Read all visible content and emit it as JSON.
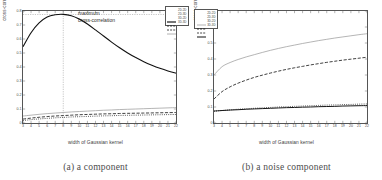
{
  "figure": {
    "panels": [
      {
        "id": "panel-a",
        "caption": "(a) a component",
        "annotation_line1": "maximum",
        "annotation_line2": "cross-correlation",
        "legend_position": "top-right"
      },
      {
        "id": "panel-b",
        "caption": "(b) a noise component",
        "legend_position": "top-left"
      }
    ]
  },
  "chart_data": [
    {
      "type": "line",
      "title": "",
      "subtitle": "(a) a component",
      "xlabel": "width of Gaussian kernel",
      "ylabel": "cross-correlation",
      "xlim": [
        3,
        22
      ],
      "ylim": [
        0,
        0.8
      ],
      "grid": false,
      "legend_position": "upper right",
      "xticks": [
        3,
        4,
        5,
        6,
        7,
        8,
        9,
        10,
        11,
        12,
        13,
        14,
        15,
        16,
        17,
        18,
        19,
        20,
        21,
        22
      ],
      "xticklabels": [
        "3",
        "4",
        "5",
        "6",
        "7",
        "8",
        "9",
        "10",
        "11",
        "12",
        "13",
        "14",
        "15",
        "16",
        "17",
        "18",
        "19",
        "20",
        "21",
        "22"
      ],
      "yticks": [
        0,
        0.1,
        0.2,
        0.3,
        0.4,
        0.5,
        0.6,
        0.7,
        0.8
      ],
      "yticklabels": [
        "0",
        "0.1",
        "0.2",
        "0.3",
        "0.4",
        "0.5",
        "0.6",
        "0.7",
        "0.8"
      ],
      "annotations": [
        {
          "text": "maximum",
          "x": 11,
          "y": 0.78
        },
        {
          "text": "cross-correlation",
          "x": 11,
          "y": 0.73
        }
      ],
      "marker_lines": {
        "vertical_x": 8,
        "horizontal_y": 0.775
      },
      "x": [
        3,
        4,
        5,
        6,
        7,
        8,
        9,
        10,
        11,
        12,
        13,
        14,
        15,
        16,
        17,
        18,
        19,
        20,
        21,
        22
      ],
      "series": [
        {
          "name": "2D-2D",
          "style": "solid",
          "color": "#111111",
          "values": [
            0.545,
            0.645,
            0.715,
            0.757,
            0.773,
            0.776,
            0.766,
            0.742,
            0.707,
            0.665,
            0.621,
            0.578,
            0.537,
            0.5,
            0.467,
            0.438,
            0.413,
            0.391,
            0.372,
            0.356
          ]
        },
        {
          "name": "2D-3D",
          "style": "dashed",
          "color": "#1c1c1c",
          "values": [
            0.028,
            0.035,
            0.041,
            0.046,
            0.05,
            0.053,
            0.056,
            0.059,
            0.061,
            0.063,
            0.065,
            0.066,
            0.068,
            0.069,
            0.07,
            0.071,
            0.072,
            0.073,
            0.074,
            0.075
          ]
        },
        {
          "name": "3D-2D",
          "style": "dotted",
          "color": "#2a2a2a",
          "values": [
            0.018,
            0.024,
            0.029,
            0.033,
            0.037,
            0.04,
            0.043,
            0.045,
            0.047,
            0.049,
            0.051,
            0.052,
            0.054,
            0.055,
            0.056,
            0.057,
            0.058,
            0.059,
            0.06,
            0.061
          ]
        },
        {
          "name": "3D-3D",
          "style": "solid-light",
          "color": "#9a9a9a",
          "values": [
            0.05,
            0.056,
            0.062,
            0.067,
            0.071,
            0.075,
            0.079,
            0.082,
            0.085,
            0.088,
            0.091,
            0.093,
            0.096,
            0.098,
            0.1,
            0.102,
            0.104,
            0.106,
            0.108,
            0.11
          ]
        }
      ]
    },
    {
      "type": "line",
      "title": "",
      "subtitle": "(b) a noise component",
      "xlabel": "width of Gaussian kernel",
      "ylabel": "cross-correlation",
      "xlim": [
        3,
        22
      ],
      "ylim": [
        0,
        0.7
      ],
      "grid": false,
      "legend_position": "upper left",
      "xticks": [
        3,
        4,
        5,
        6,
        7,
        8,
        9,
        10,
        11,
        12,
        13,
        14,
        15,
        16,
        17,
        18,
        19,
        20,
        21,
        22
      ],
      "xticklabels": [
        "3",
        "4",
        "5",
        "6",
        "7",
        "8",
        "9",
        "10",
        "11",
        "12",
        "13",
        "14",
        "15",
        "16",
        "17",
        "18",
        "19",
        "20",
        "21",
        "22"
      ],
      "yticks": [
        0,
        0.1,
        0.2,
        0.3,
        0.4,
        0.5,
        0.6,
        0.7
      ],
      "yticklabels": [
        "0",
        "0.1",
        "0.2",
        "0.3",
        "0.4",
        "0.5",
        "0.6",
        "0.7"
      ],
      "x": [
        3,
        4,
        5,
        6,
        7,
        8,
        9,
        10,
        11,
        12,
        13,
        14,
        15,
        16,
        17,
        18,
        19,
        20,
        21,
        22
      ],
      "series": [
        {
          "name": "2D-2D",
          "style": "solid-light",
          "color": "#9a9a9a",
          "values": [
            0.3,
            0.352,
            0.378,
            0.397,
            0.413,
            0.427,
            0.441,
            0.454,
            0.466,
            0.477,
            0.487,
            0.497,
            0.506,
            0.515,
            0.523,
            0.531,
            0.538,
            0.545,
            0.552,
            0.558
          ]
        },
        {
          "name": "2D-3D",
          "style": "dashed",
          "color": "#1c1c1c",
          "values": [
            0.15,
            0.196,
            0.226,
            0.249,
            0.268,
            0.285,
            0.299,
            0.312,
            0.324,
            0.335,
            0.345,
            0.354,
            0.363,
            0.371,
            0.379,
            0.386,
            0.393,
            0.399,
            0.405,
            0.411
          ]
        },
        {
          "name": "3D-2D",
          "style": "dotted",
          "color": "#2a2a2a",
          "values": [
            0.073,
            0.078,
            0.082,
            0.086,
            0.089,
            0.092,
            0.095,
            0.097,
            0.1,
            0.102,
            0.104,
            0.106,
            0.108,
            0.11,
            0.112,
            0.113,
            0.115,
            0.116,
            0.118,
            0.119
          ]
        },
        {
          "name": "3D-3D",
          "style": "solid-dark",
          "color": "#111111",
          "values": [
            0.075,
            0.078,
            0.081,
            0.083,
            0.086,
            0.088,
            0.09,
            0.092,
            0.094,
            0.096,
            0.097,
            0.099,
            0.1,
            0.102,
            0.103,
            0.104,
            0.106,
            0.107,
            0.108,
            0.109
          ]
        }
      ]
    }
  ]
}
